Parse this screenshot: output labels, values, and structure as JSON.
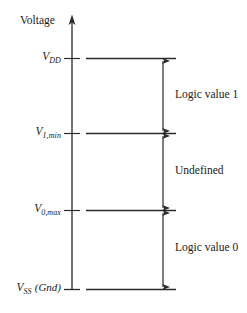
{
  "figure": {
    "background_color": "#ffffff",
    "line_color": "#2b2b2b",
    "text_color": "#1a1a1a",
    "axis": {
      "label": "Voltage",
      "orientation": "vertical",
      "arrow_direction": "up"
    },
    "levels": [
      {
        "id": "vdd",
        "symbol": "V",
        "subscript": "DD",
        "suffix": "",
        "label_text": "V_DD",
        "y": 58
      },
      {
        "id": "v1min",
        "symbol": "V",
        "subscript": "1,min",
        "suffix": "",
        "label_text": "V_1,min",
        "y": 133
      },
      {
        "id": "v0max",
        "symbol": "V",
        "subscript": "0,max",
        "suffix": "",
        "label_text": "V_0,max",
        "y": 210
      },
      {
        "id": "vss",
        "symbol": "V",
        "subscript": "SS",
        "suffix": "(Gnd)",
        "label_text": "V_SS (Gnd)",
        "y": 289
      }
    ],
    "regions": [
      {
        "id": "logic-1",
        "label": "Logic value 1",
        "from_level": "V_1,min",
        "to_level": "V_DD",
        "center_y": 95
      },
      {
        "id": "undefined",
        "label": "Undefined",
        "from_level": "V_0,max",
        "to_level": "V_1,min",
        "center_y": 171
      },
      {
        "id": "logic-0",
        "label": "Logic value 0",
        "from_level": "V_SS (Gnd)",
        "to_level": "V_0,max",
        "center_y": 248
      }
    ]
  }
}
